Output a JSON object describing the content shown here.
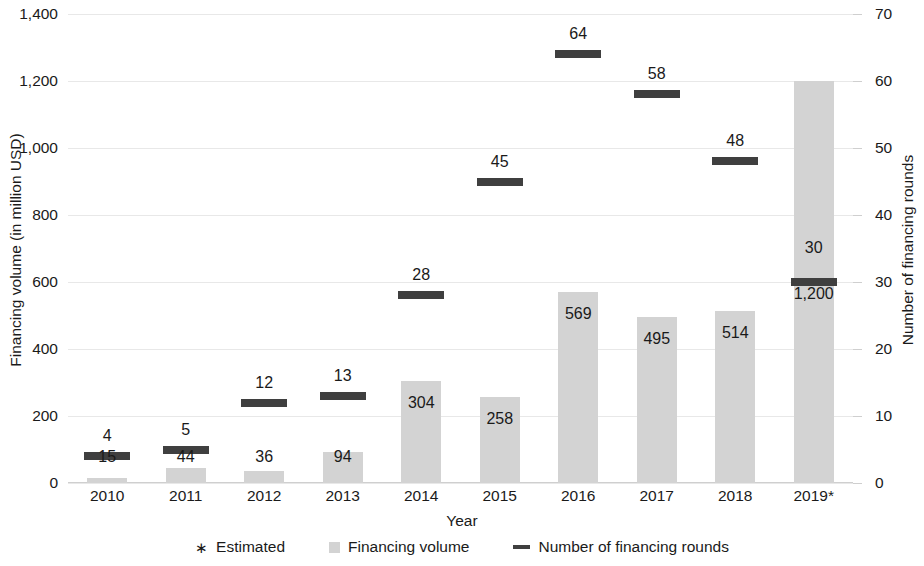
{
  "chart_data": {
    "type": "bar",
    "title": "",
    "xlabel": "Year",
    "ylabel": "Financing volume (in million USD)",
    "y2label": "Number of financing rounds",
    "categories": [
      "2010",
      "2011",
      "2012",
      "2013",
      "2014",
      "2015",
      "2016",
      "2017",
      "2018",
      "2019*"
    ],
    "ylim": [
      0,
      1400
    ],
    "y2lim": [
      0,
      70
    ],
    "yticks": [
      "0",
      "200",
      "400",
      "600",
      "800",
      "1,000",
      "1,200",
      "1,400"
    ],
    "ytick_values": [
      0,
      200,
      400,
      600,
      800,
      1000,
      1200,
      1400
    ],
    "y2ticks": [
      "0",
      "10",
      "20",
      "30",
      "40",
      "50",
      "60",
      "70"
    ],
    "y2tick_values": [
      0,
      10,
      20,
      30,
      40,
      50,
      60,
      70
    ],
    "grid": true,
    "legend_position": "bottom",
    "series": [
      {
        "name": "Financing volume",
        "axis": "left",
        "type": "bar",
        "color": "#d3d3d3",
        "values": [
          15,
          44,
          36,
          94,
          304,
          258,
          569,
          495,
          514,
          1200
        ],
        "labels": [
          "15",
          "44",
          "36",
          "94",
          "304",
          "258",
          "569",
          "495",
          "514",
          "1,200"
        ]
      },
      {
        "name": "Number of financing rounds",
        "axis": "right",
        "type": "marker-dash",
        "color": "#3f3f3f",
        "values": [
          4,
          5,
          12,
          13,
          28,
          45,
          64,
          58,
          48,
          30
        ],
        "labels": [
          "4",
          "5",
          "12",
          "13",
          "28",
          "45",
          "64",
          "58",
          "48",
          "30"
        ]
      }
    ],
    "annotations": [
      "* Estimated"
    ]
  },
  "axes": {
    "y_left_title": "Financing volume (in million USD)",
    "y_right_title": "Number of financing rounds",
    "x_title": "Year"
  },
  "legend": {
    "items": [
      {
        "label": "Estimated",
        "marker": "asterisk-marker",
        "glyph": "∗"
      },
      {
        "label": "Financing volume",
        "marker": "gray-square-swatch"
      },
      {
        "label": "Number of financing rounds",
        "marker": "dark-dash-swatch"
      }
    ]
  }
}
